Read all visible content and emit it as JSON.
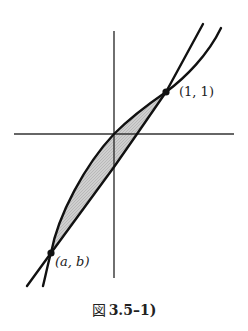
{
  "figure": {
    "caption_prefix": "図",
    "caption_number": "3.5–1)",
    "point_labels": {
      "p1": "(1, 1)",
      "p2": "(a, b)"
    },
    "colors": {
      "stroke": "#111111",
      "axis": "#333333",
      "fill": "#c8c8c8"
    },
    "elements": {
      "axes": "x-axis and y-axis crossing at origin",
      "curve": "curve through (a, b), origin and (1, 1)",
      "line": "straight line through (a, b) and (1, 1)",
      "shaded_region": "region enclosed between curve and line from (a, b) to (1, 1)"
    }
  }
}
